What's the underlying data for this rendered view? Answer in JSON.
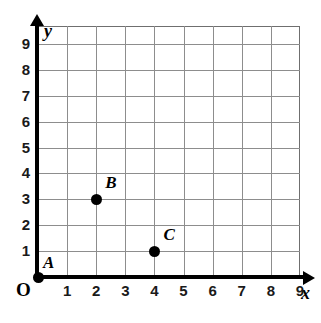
{
  "chart_data": {
    "type": "scatter",
    "title": "",
    "xlabel": "x",
    "ylabel": "y",
    "xlim": [
      0,
      9
    ],
    "ylim": [
      0,
      9
    ],
    "grid": true,
    "legend": false,
    "origin_label": "O",
    "x_ticks": [
      "1",
      "2",
      "3",
      "4",
      "5",
      "6",
      "7",
      "8",
      "9"
    ],
    "y_ticks": [
      "1",
      "2",
      "3",
      "4",
      "5",
      "6",
      "7",
      "8",
      "9"
    ],
    "points": [
      {
        "label": "A",
        "x": 0,
        "y": 0
      },
      {
        "label": "B",
        "x": 2,
        "y": 3
      },
      {
        "label": "C",
        "x": 4,
        "y": 1
      }
    ]
  }
}
